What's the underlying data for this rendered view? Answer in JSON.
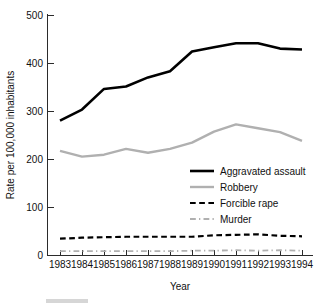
{
  "chart_data": {
    "type": "line",
    "title": "",
    "subtitle": "",
    "xlabel": "Year",
    "ylabel": "Rate per 100,000 inhabitants",
    "x": [
      1983,
      1984,
      1985,
      1986,
      1987,
      1988,
      1989,
      1990,
      1991,
      1992,
      1993,
      1994
    ],
    "categories": [
      "1983",
      "1984",
      "1985",
      "1986",
      "1987",
      "1988",
      "1989",
      "1990",
      "1991",
      "1992",
      "1993",
      "1994"
    ],
    "xlim": [
      1983,
      1994
    ],
    "ylim": [
      0,
      500
    ],
    "yticks": [
      0,
      100,
      200,
      300,
      400,
      500
    ],
    "ytick_labels": [
      "0",
      "100",
      "200",
      "300",
      "400",
      "500"
    ],
    "xtick_labels": [
      "1983",
      "1984",
      "1985",
      "1986",
      "1987",
      "1988",
      "1989",
      "1990",
      "1991",
      "1992",
      "1993",
      "1994"
    ],
    "grid": false,
    "legend_position": "center-right",
    "series": [
      {
        "name": "Aggravated assault",
        "color": "#000000",
        "style": "solid",
        "width": 2.6,
        "values": [
          280,
          303,
          346,
          351,
          370,
          383,
          424,
          433,
          441,
          441,
          430,
          428
        ]
      },
      {
        "name": "Robbery",
        "color": "#b0b0b0",
        "style": "solid",
        "width": 2.4,
        "values": [
          217,
          205,
          209,
          221,
          213,
          221,
          234,
          257,
          272,
          264,
          256,
          238
        ]
      },
      {
        "name": "Forcible rape",
        "color": "#000000",
        "style": "dashed",
        "width": 2.2,
        "values": [
          34,
          36,
          37,
          38,
          38,
          38,
          38,
          41,
          42,
          43,
          40,
          39
        ]
      },
      {
        "name": "Murder",
        "color": "#b0b0b0",
        "style": "dashdot",
        "width": 1.8,
        "values": [
          8,
          8,
          8,
          8,
          8,
          8,
          9,
          9,
          10,
          9,
          10,
          9
        ]
      }
    ]
  },
  "axes": {
    "y_title": "Rate per 100,000 inhabitants",
    "x_title": "Year",
    "y_ticks": [
      {
        "label": "500"
      },
      {
        "label": "400"
      },
      {
        "label": "300"
      },
      {
        "label": "200"
      },
      {
        "label": "100"
      },
      {
        "label": "0"
      }
    ],
    "x_ticks": [
      {
        "label": "1983"
      },
      {
        "label": "1984"
      },
      {
        "label": "1985"
      },
      {
        "label": "1986"
      },
      {
        "label": "1987"
      },
      {
        "label": "1988"
      },
      {
        "label": "1989"
      },
      {
        "label": "1990"
      },
      {
        "label": "1991"
      },
      {
        "label": "1992"
      },
      {
        "label": "1993"
      },
      {
        "label": "1994"
      }
    ]
  },
  "legend": {
    "entries": [
      {
        "label": "Aggravated assault",
        "color": "#000000",
        "style": "solid"
      },
      {
        "label": "Robbery",
        "color": "#b0b0b0",
        "style": "solid"
      },
      {
        "label": "Forcible rape",
        "color": "#000000",
        "style": "dashed"
      },
      {
        "label": "Murder",
        "color": "#b0b0b0",
        "style": "dashdot"
      }
    ]
  },
  "colors": {
    "aggravated_assault": "#000000",
    "robbery": "#b0b0b0",
    "forcible_rape": "#000000",
    "murder": "#b0b0b0",
    "axis": "#2b2b2b",
    "text": "#111111",
    "background": "#ffffff"
  }
}
